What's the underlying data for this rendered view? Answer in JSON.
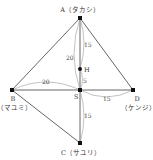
{
  "diagram": {
    "points": {
      "A": {
        "label": "A（タカシ）",
        "x": 80,
        "y": 18
      },
      "H": {
        "label": "H",
        "x": 80,
        "y": 69
      },
      "S": {
        "label": "S",
        "x": 80,
        "y": 90
      },
      "B": {
        "label": "B",
        "sub": "（マユミ）",
        "x": 12,
        "y": 90
      },
      "D": {
        "label": "D",
        "sub": "（ケンジ）",
        "x": 133,
        "y": 90
      },
      "C": {
        "label": "C（サユリ）",
        "x": 80,
        "y": 143
      }
    },
    "measures": {
      "AH": "15",
      "AS": "20",
      "HS": "5",
      "BS": "20",
      "SD": "15",
      "SC": "15"
    },
    "colors": {
      "line": "#555555",
      "arc": "#999999",
      "point": "#111111"
    }
  }
}
